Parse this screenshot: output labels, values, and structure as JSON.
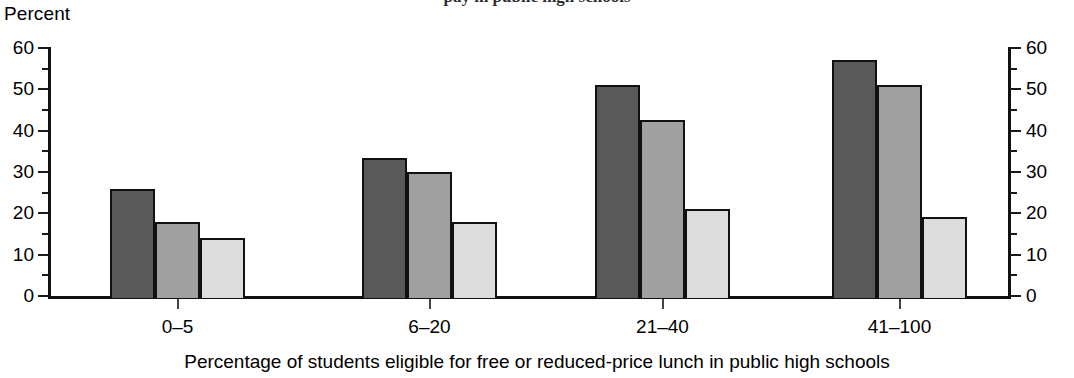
{
  "title": {
    "text": "pay in public high schools",
    "clipped": true
  },
  "axes": {
    "y_unit_label": "Percent",
    "y_ticks": [
      "0",
      "10",
      "20",
      "30",
      "40",
      "50",
      "60"
    ],
    "y_ticks_right": [
      "0",
      "10",
      "20",
      "30",
      "40",
      "50",
      "60"
    ],
    "y_minor_step": 5,
    "x_title": "Percentage of students eligible for free or reduced-price lunch in public high schools",
    "x_categories": [
      "0–5",
      "6–20",
      "21–40",
      "41–100"
    ]
  },
  "colors": {
    "series_dark": "#595959",
    "series_medium": "#a0a0a0",
    "series_light": "#dcdcdc",
    "outline": "#111111",
    "background": "#ffffff"
  },
  "chart_data": {
    "type": "bar",
    "title": "pay in public high schools",
    "xlabel": "Percentage of students eligible for free or reduced-price lunch in public high schools",
    "ylabel": "Percent",
    "ylim": [
      0,
      60
    ],
    "ytick_step": 10,
    "grid": false,
    "legend": "none",
    "categories": [
      "0–5",
      "6–20",
      "21–40",
      "41–100"
    ],
    "series": [
      {
        "name": "series-1-dark",
        "color": "#595959",
        "values": [
          26,
          33.5,
          51,
          57
        ]
      },
      {
        "name": "series-2-medium",
        "color": "#a0a0a0",
        "values": [
          18,
          30,
          42.5,
          51
        ]
      },
      {
        "name": "series-3-light",
        "color": "#dcdcdc",
        "values": [
          14,
          18,
          21,
          19
        ]
      }
    ]
  }
}
